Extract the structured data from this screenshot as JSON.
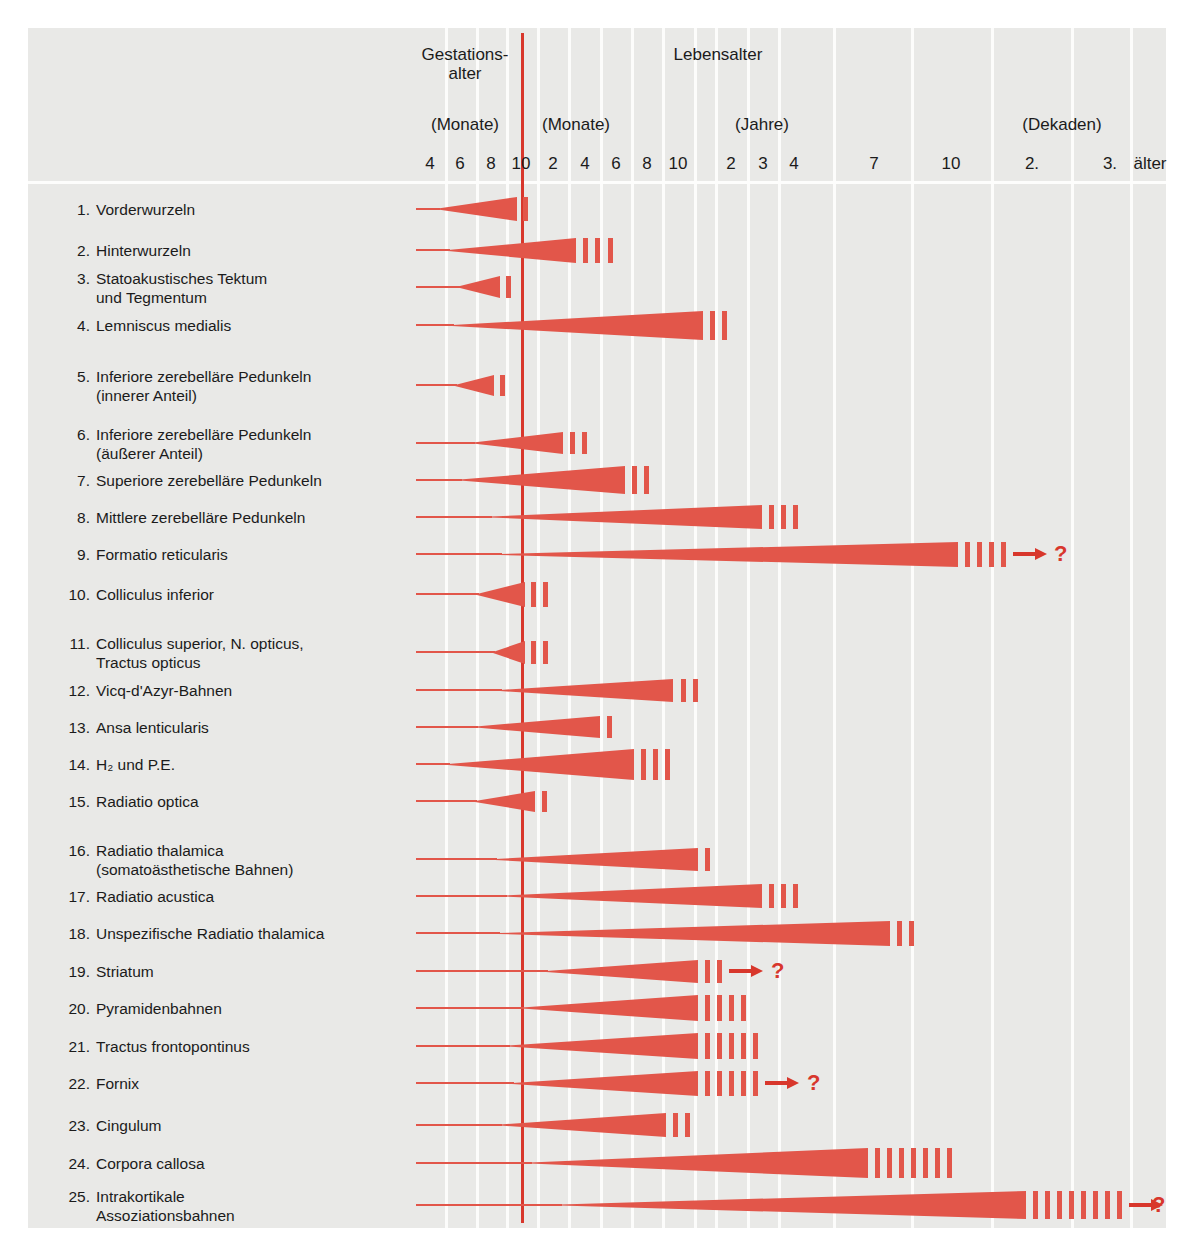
{
  "figure": {
    "background_color": "#e9e9e7",
    "accent_color": "#e2564a",
    "birth_line_color": "#d8372c",
    "text_color": "#1b1b1b"
  },
  "header": {
    "groups": [
      {
        "name": "gestational-age",
        "label": "Gestations-",
        "label2": "alter"
      },
      {
        "name": "life-age",
        "label": "Lebensalter",
        "label2": ""
      }
    ],
    "units": [
      {
        "name": "unit-months-gestation",
        "label": "(Monate)"
      },
      {
        "name": "unit-months-life",
        "label": "(Monate)"
      },
      {
        "name": "unit-years",
        "label": "(Jahre)"
      },
      {
        "name": "unit-decades",
        "label": "(Dekaden)"
      }
    ],
    "ticks": [
      {
        "label": "4",
        "x": 430
      },
      {
        "label": "6",
        "x": 460
      },
      {
        "label": "8",
        "x": 491
      },
      {
        "label": "10",
        "x": 521
      },
      {
        "label": "2",
        "x": 553
      },
      {
        "label": "4",
        "x": 585
      },
      {
        "label": "6",
        "x": 616
      },
      {
        "label": "8",
        "x": 647
      },
      {
        "label": "10",
        "x": 678
      },
      {
        "label": "2",
        "x": 731
      },
      {
        "label": "3",
        "x": 763
      },
      {
        "label": "4",
        "x": 794
      },
      {
        "label": "7",
        "x": 874
      },
      {
        "label": "10",
        "x": 951
      },
      {
        "label": "2.",
        "x": 1032
      },
      {
        "label": "3.",
        "x": 1110
      },
      {
        "label": "älter",
        "x": 1150
      }
    ]
  },
  "chart_data": {
    "type": "bar",
    "xlabel": "Gestationsalter / Lebensalter",
    "ylabel": "",
    "grid": true,
    "legend_position": "none",
    "axis_sections": [
      {
        "name": "Gestationsalter",
        "unit": "(Monate)",
        "ticks": [
          "4",
          "6",
          "8",
          "10"
        ]
      },
      {
        "name": "Lebensalter",
        "unit": "(Monate)",
        "ticks": [
          "2",
          "4",
          "6",
          "8",
          "10"
        ]
      },
      {
        "name": "Lebensalter",
        "unit": "(Jahre)",
        "ticks": [
          "2",
          "3",
          "4",
          "7",
          "10"
        ]
      },
      {
        "name": "Lebensalter",
        "unit": "(Dekaden)",
        "ticks": [
          "2.",
          "3.",
          "älter"
        ]
      }
    ],
    "categories": [
      "Vorderwurzeln",
      "Hinterwurzeln",
      "Statoakustisches Tektum und Tegmentum",
      "Lemniscus medialis",
      "Inferiore zerebelläre Pedunkeln (innerer Anteil)",
      "Inferiore zerebelläre Pedunkeln (äußerer Anteil)",
      "Superiore zerebelläre Pedunkeln",
      "Mittlere zerebelläre Pedunkeln",
      "Formatio reticularis",
      "Colliculus inferior",
      "Colliculus superior, N. opticus, Tractus opticus",
      "Vicq-d'Azyr-Bahnen",
      "Ansa lenticularis",
      "H2 und P.E.",
      "Radiatio optica",
      "Radiatio thalamica (somatoästhetische Bahnen)",
      "Radiatio acustica",
      "Unspezifische Radiatio thalamica",
      "Striatum",
      "Pyramidenbahnen",
      "Tractus frontopontinus",
      "Fornix",
      "Cingulum",
      "Corpora callosa",
      "Intrakortikale Assoziationsbahnen"
    ]
  },
  "rows": [
    {
      "n": "1.",
      "l1": "Vorderwurzeln",
      "l2": "",
      "y": 209,
      "label_y": 200,
      "track_x": 416,
      "wedge_x0": 438,
      "wedge_x1": 517,
      "h0": 1,
      "h1": 24,
      "ticks": [
        523
      ],
      "tick_h": 24,
      "arrow": false
    },
    {
      "n": "2.",
      "l1": "Hinterwurzeln",
      "l2": "",
      "y": 250,
      "label_y": 241,
      "track_x": 416,
      "wedge_x0": 448,
      "wedge_x1": 576,
      "h0": 1,
      "h1": 25,
      "ticks": [
        583,
        595,
        608
      ],
      "tick_h": 25,
      "arrow": false
    },
    {
      "n": "3.",
      "l1": "Statoakustisches Tektum",
      "l2": "und Tegmentum",
      "y": 287,
      "label_y": 269,
      "track_x": 416,
      "wedge_x0": 458,
      "wedge_x1": 500,
      "h0": 1,
      "h1": 22,
      "ticks": [
        506
      ],
      "tick_h": 22,
      "arrow": false
    },
    {
      "n": "4.",
      "l1": "Lemniscus medialis",
      "l2": "",
      "y": 325,
      "label_y": 316,
      "track_x": 416,
      "wedge_x0": 452,
      "wedge_x1": 703,
      "h0": 1,
      "h1": 29,
      "ticks": [
        710,
        722
      ],
      "tick_h": 29,
      "arrow": false
    },
    {
      "n": "5.",
      "l1": "Inferiore zerebelläre Pedunkeln",
      "l2": "(innerer Anteil)",
      "y": 385,
      "label_y": 367,
      "track_x": 416,
      "wedge_x0": 455,
      "wedge_x1": 494,
      "h0": 1,
      "h1": 21,
      "ticks": [
        500
      ],
      "tick_h": 21,
      "arrow": false
    },
    {
      "n": "6.",
      "l1": "Inferiore zerebelläre Pedunkeln",
      "l2": "(äußerer Anteil)",
      "y": 443,
      "label_y": 425,
      "track_x": 416,
      "wedge_x0": 473,
      "wedge_x1": 563,
      "h0": 1,
      "h1": 22,
      "ticks": [
        570,
        582
      ],
      "tick_h": 22,
      "arrow": false
    },
    {
      "n": "7.",
      "l1": "Superiore zerebelläre Pedunkeln",
      "l2": "",
      "y": 480,
      "label_y": 471,
      "track_x": 416,
      "wedge_x0": 460,
      "wedge_x1": 625,
      "h0": 1,
      "h1": 28,
      "ticks": [
        632,
        644
      ],
      "tick_h": 28,
      "arrow": false
    },
    {
      "n": "8.",
      "l1": "Mittlere zerebelläre Pedunkeln",
      "l2": "",
      "y": 517,
      "label_y": 508,
      "track_x": 416,
      "wedge_x0": 490,
      "wedge_x1": 762,
      "h0": 1,
      "h1": 24,
      "ticks": [
        769,
        781,
        793
      ],
      "tick_h": 24,
      "arrow": false
    },
    {
      "n": "9.",
      "l1": "Formatio reticularis",
      "l2": "",
      "y": 554,
      "label_y": 545,
      "track_x": 416,
      "wedge_x0": 500,
      "wedge_x1": 958,
      "h0": 1,
      "h1": 25,
      "ticks": [
        965,
        977,
        989,
        1001
      ],
      "tick_h": 25,
      "arrow": true,
      "arrow_x": 1013,
      "q_x": 1054
    },
    {
      "n": "10.",
      "l1": "Colliculus inferior",
      "l2": "",
      "y": 594,
      "label_y": 585,
      "track_x": 416,
      "wedge_x0": 477,
      "wedge_x1": 525,
      "h0": 1,
      "h1": 25,
      "ticks": [
        531,
        543
      ],
      "tick_h": 25,
      "arrow": false
    },
    {
      "n": "11.",
      "l1": "Colliculus superior, N. opticus,",
      "l2": "Tractus opticus",
      "y": 652,
      "label_y": 634,
      "track_x": 416,
      "wedge_x0": 493,
      "wedge_x1": 525,
      "h0": 1,
      "h1": 23,
      "ticks": [
        531,
        543
      ],
      "tick_h": 23,
      "arrow": false
    },
    {
      "n": "12.",
      "l1": "Vicq-d'Azyr-Bahnen",
      "l2": "",
      "y": 690,
      "label_y": 681,
      "track_x": 416,
      "wedge_x0": 500,
      "wedge_x1": 673,
      "h0": 1,
      "h1": 23,
      "ticks": [
        681,
        693
      ],
      "tick_h": 23,
      "arrow": false
    },
    {
      "n": "13.",
      "l1": "Ansa lenticularis",
      "l2": "",
      "y": 727,
      "label_y": 718,
      "track_x": 416,
      "wedge_x0": 476,
      "wedge_x1": 600,
      "h0": 1,
      "h1": 22,
      "ticks": [
        607
      ],
      "tick_h": 22,
      "arrow": false
    },
    {
      "n": "14.",
      "l1": "H₂ und P.E.",
      "l2": "",
      "y": 764,
      "label_y": 755,
      "track_x": 416,
      "wedge_x0": 448,
      "wedge_x1": 634,
      "h0": 1,
      "h1": 31,
      "ticks": [
        641,
        653,
        665
      ],
      "tick_h": 31,
      "arrow": false
    },
    {
      "n": "15.",
      "l1": "Radiatio optica",
      "l2": "",
      "y": 801,
      "label_y": 792,
      "track_x": 416,
      "wedge_x0": 475,
      "wedge_x1": 535,
      "h0": 1,
      "h1": 21,
      "ticks": [
        542
      ],
      "tick_h": 21,
      "arrow": false
    },
    {
      "n": "16.",
      "l1": "Radiatio thalamica",
      "l2": "(somatoästhetische Bahnen)",
      "y": 859,
      "label_y": 841,
      "track_x": 416,
      "wedge_x0": 495,
      "wedge_x1": 698,
      "h0": 1,
      "h1": 23,
      "ticks": [
        705
      ],
      "tick_h": 23,
      "arrow": false
    },
    {
      "n": "17.",
      "l1": "Radiatio acustica",
      "l2": "",
      "y": 896,
      "label_y": 887,
      "track_x": 416,
      "wedge_x0": 505,
      "wedge_x1": 762,
      "h0": 1,
      "h1": 24,
      "ticks": [
        769,
        781,
        793
      ],
      "tick_h": 24,
      "arrow": false
    },
    {
      "n": "18.",
      "l1": "Unspezifische Radiatio thalamica",
      "l2": "",
      "y": 933,
      "label_y": 924,
      "track_x": 416,
      "wedge_x0": 498,
      "wedge_x1": 890,
      "h0": 1,
      "h1": 25,
      "ticks": [
        897,
        909
      ],
      "tick_h": 25,
      "arrow": false
    },
    {
      "n": "19.",
      "l1": "Striatum",
      "l2": "",
      "y": 971,
      "label_y": 962,
      "track_x": 416,
      "wedge_x0": 546,
      "wedge_x1": 698,
      "h0": 1,
      "h1": 23,
      "ticks": [
        705,
        717
      ],
      "tick_h": 23,
      "arrow": true,
      "arrow_x": 729,
      "q_x": 771
    },
    {
      "n": "20.",
      "l1": "Pyramidenbahnen",
      "l2": "",
      "y": 1008,
      "label_y": 999,
      "track_x": 416,
      "wedge_x0": 522,
      "wedge_x1": 698,
      "h0": 1,
      "h1": 26,
      "ticks": [
        705,
        717,
        729,
        741
      ],
      "tick_h": 26,
      "arrow": false
    },
    {
      "n": "21.",
      "l1": "Tractus frontopontinus",
      "l2": "",
      "y": 1046,
      "label_y": 1037,
      "track_x": 416,
      "wedge_x0": 508,
      "wedge_x1": 698,
      "h0": 1,
      "h1": 26,
      "ticks": [
        705,
        717,
        729,
        741,
        753
      ],
      "tick_h": 26,
      "arrow": false
    },
    {
      "n": "22.",
      "l1": "Fornix",
      "l2": "",
      "y": 1083,
      "label_y": 1074,
      "track_x": 416,
      "wedge_x0": 512,
      "wedge_x1": 698,
      "h0": 1,
      "h1": 25,
      "ticks": [
        705,
        717,
        729,
        741,
        753
      ],
      "tick_h": 25,
      "arrow": true,
      "arrow_x": 765,
      "q_x": 807
    },
    {
      "n": "23.",
      "l1": "Cingulum",
      "l2": "",
      "y": 1125,
      "label_y": 1116,
      "track_x": 416,
      "wedge_x0": 500,
      "wedge_x1": 666,
      "h0": 1,
      "h1": 24,
      "ticks": [
        673,
        685
      ],
      "tick_h": 24,
      "arrow": false
    },
    {
      "n": "24.",
      "l1": "Corpora callosa",
      "l2": "",
      "y": 1163,
      "label_y": 1154,
      "track_x": 416,
      "wedge_x0": 530,
      "wedge_x1": 868,
      "h0": 1,
      "h1": 30,
      "ticks": [
        875,
        887,
        899,
        911,
        923,
        935,
        947
      ],
      "tick_h": 30,
      "arrow": false
    },
    {
      "n": "25.",
      "l1": "Intrakortikale",
      "l2": "Assoziationsbahnen",
      "y": 1205,
      "label_y": 1187,
      "track_x": 416,
      "wedge_x0": 560,
      "wedge_x1": 1026,
      "h0": 1,
      "h1": 28,
      "ticks": [
        1033,
        1045,
        1057,
        1069,
        1081,
        1093,
        1105,
        1117
      ],
      "tick_h": 28,
      "arrow": true,
      "arrow_x": 1129,
      "q_x": 1152
    }
  ],
  "gridlines_x": [
    445,
    476,
    506,
    537,
    568,
    600,
    631,
    662,
    694,
    715,
    747,
    778,
    833,
    911,
    991,
    1071,
    1130
  ],
  "layout": {
    "plate_left": 28,
    "plate_top": 28,
    "plate_w": 1138,
    "plate_h": 1200,
    "birth_line_x": 521,
    "hline_y": 181
  }
}
